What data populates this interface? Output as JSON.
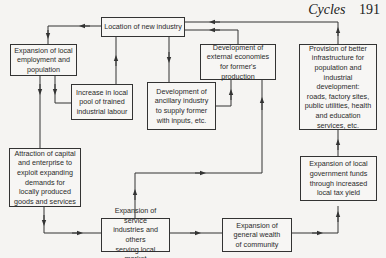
{
  "header": {
    "title": "Cycles",
    "page_number": "191"
  },
  "boxes": {
    "location": "Location of new industry",
    "employment": "Expansion of local\nemployment and\npopulation",
    "labour": "Increase in local\npool of trained\nindustrial labour",
    "ancillary": "Development of\nancillary industry\nto supply former\nwith inputs, etc.",
    "external": "Development of\nexternal economies\nfor former's production",
    "infrastructure": "Provision of better\ninfrastructure for\npopulation and\nindustrial development:\nroads, factory sites,\npublic utilities, health\nand education\nservices, etc.",
    "capital": "Attraction of capital\nand enterprise to\nexploit expanding\ndemands for\nlocally produced\ngoods and services",
    "services": "Expansion of service\nindustries and others\nserving local market",
    "wealth": "Expansion of\ngeneral  wealth\nof community",
    "government": "Expansion of local\ngovernment funds\nthrough increased\nlocal tax yield"
  },
  "colors": {
    "line": "#333333",
    "box_border": "#333333",
    "background": "#f5f4f2"
  }
}
